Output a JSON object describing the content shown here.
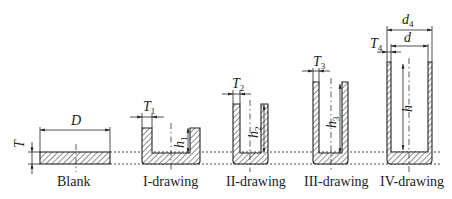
{
  "diagram": {
    "reference_lines": [
      "blank top level",
      "blank bottom level"
    ],
    "stages": [
      {
        "id": "blank",
        "label": "Blank",
        "dims": {
          "diameter": "D",
          "thickness": "T"
        }
      },
      {
        "id": "stage1",
        "label": "I-drawing",
        "dims": {
          "thickness": "T",
          "thickness_sub": "1",
          "height": "h",
          "height_sub": "1"
        }
      },
      {
        "id": "stage2",
        "label": "II-drawing",
        "dims": {
          "thickness": "T",
          "thickness_sub": "2",
          "height": "h",
          "height_sub": "2"
        }
      },
      {
        "id": "stage3",
        "label": "III-drawing",
        "dims": {
          "thickness": "T",
          "thickness_sub": "3",
          "height": "h",
          "height_sub": "3"
        }
      },
      {
        "id": "stage4",
        "label": "IV-drawing",
        "dims": {
          "thickness": "T",
          "thickness_sub": "4",
          "height": "h",
          "outer_diameter": "d",
          "outer_diameter_sub": "4",
          "inner_diameter": "d"
        }
      }
    ]
  }
}
